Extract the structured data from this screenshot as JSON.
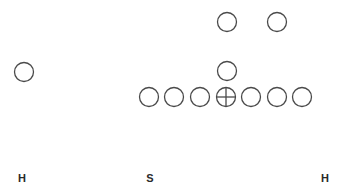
{
  "diagram": {
    "type": "football-formation",
    "stroke_color": "#4a4a4a",
    "background": "#ffffff",
    "circle_radius": 9.5,
    "players": [
      {
        "id": "split-end-left",
        "x": 24,
        "y": 72,
        "center": false
      },
      {
        "id": "back-1",
        "x": 227,
        "y": 22,
        "center": false
      },
      {
        "id": "back-2",
        "x": 277,
        "y": 22,
        "center": false
      },
      {
        "id": "back-3",
        "x": 227,
        "y": 71,
        "center": false
      },
      {
        "id": "line-1",
        "x": 149,
        "y": 97,
        "center": false
      },
      {
        "id": "line-2",
        "x": 174,
        "y": 97,
        "center": false
      },
      {
        "id": "line-3",
        "x": 200,
        "y": 97,
        "center": false
      },
      {
        "id": "line-center",
        "x": 226,
        "y": 97,
        "center": true
      },
      {
        "id": "line-5",
        "x": 251,
        "y": 97,
        "center": false
      },
      {
        "id": "line-6",
        "x": 277,
        "y": 97,
        "center": false
      },
      {
        "id": "line-7",
        "x": 302,
        "y": 97,
        "center": false
      }
    ],
    "labels": [
      {
        "text": "H",
        "x": 22,
        "y": 178
      },
      {
        "text": "S",
        "x": 150,
        "y": 178
      },
      {
        "text": "H",
        "x": 325,
        "y": 178
      }
    ]
  }
}
